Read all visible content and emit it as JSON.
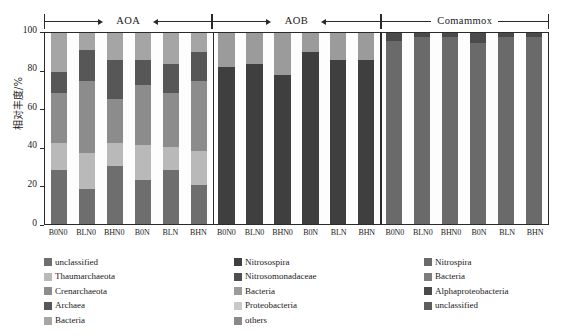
{
  "axes": {
    "y_title": "相对丰度/%",
    "y_ticks": [
      "0",
      "20",
      "40",
      "60",
      "80",
      "100"
    ]
  },
  "groups": [
    {
      "label": "AOA"
    },
    {
      "label": "AOB"
    },
    {
      "label": "Comammox"
    }
  ],
  "x_labels": [
    "B0N0",
    "BLN0",
    "BHN0",
    "B0N",
    "BLN",
    "BHN",
    "B0N0",
    "BLN0",
    "BHN0",
    "B0N",
    "BLN",
    "BHN",
    "B0N0",
    "BLN0",
    "BHN0",
    "B0N",
    "BLN",
    "BHN"
  ],
  "legend": {
    "columns": [
      {
        "items": [
          {
            "label": "unclassified",
            "color": "#6e6e6e"
          },
          {
            "label": "Thaumarchaeota",
            "color": "#b9b9b9"
          },
          {
            "label": "Crenarchaeota",
            "color": "#8c8c8c"
          },
          {
            "label": "Archaea",
            "color": "#575757"
          },
          {
            "label": "Bacteria",
            "color": "#a5a5a5"
          }
        ]
      },
      {
        "items": [
          {
            "label": "Nitrosospira",
            "color": "#3f3f3f"
          },
          {
            "label": "Nitrosomonadaceae",
            "color": "#4f4f4f"
          },
          {
            "label": "Bacteria",
            "color": "#9b9b9b"
          },
          {
            "label": "Proteobacteria",
            "color": "#c9c9c9"
          },
          {
            "label": "others",
            "color": "#8a8a8a"
          }
        ]
      },
      {
        "items": [
          {
            "label": "Nitrospira",
            "color": "#6a6a6a"
          },
          {
            "label": "Bacteria",
            "color": "#7d7d7d"
          },
          {
            "label": "Alphaproteobacteria",
            "color": "#4a4a4a"
          },
          {
            "label": "unclassified",
            "color": "#5e5e5e"
          }
        ]
      }
    ]
  },
  "chart_data": {
    "type": "bar",
    "title": "",
    "xlabel": "",
    "ylabel": "相对丰度/%",
    "ylim": [
      0,
      100
    ],
    "grid": false,
    "stacked": true,
    "legend_position": "below",
    "categories": [
      "AOA B0N0",
      "AOA BLN0",
      "AOA BHN0",
      "AOA B0N",
      "AOA BLN",
      "AOA BHN",
      "AOB B0N0",
      "AOB BLN0",
      "AOB BHN0",
      "AOB B0N",
      "AOB BLN",
      "AOB BHN",
      "Comammox B0N0",
      "Comammox BLN0",
      "Comammox BHN0",
      "Comammox B0N",
      "Comammox BLN",
      "Comammox BHN"
    ],
    "group_spans": [
      {
        "name": "AOA",
        "start": 0,
        "end": 5
      },
      {
        "name": "AOB",
        "start": 6,
        "end": 11
      },
      {
        "name": "Comammox",
        "start": 12,
        "end": 17
      }
    ],
    "series": [
      {
        "name": "unclassified",
        "color": "#6e6e6e",
        "values": [
          28,
          18,
          30,
          23,
          28,
          20,
          0,
          0,
          0,
          0,
          0,
          0,
          0,
          0,
          0,
          0,
          0,
          0
        ]
      },
      {
        "name": "Thaumarchaeota",
        "color": "#b9b9b9",
        "values": [
          14,
          19,
          12,
          18,
          12,
          18,
          0,
          0,
          0,
          0,
          0,
          0,
          0,
          0,
          0,
          0,
          0,
          0
        ]
      },
      {
        "name": "Crenarchaeota",
        "color": "#8c8c8c",
        "values": [
          26,
          37,
          23,
          31,
          28,
          36,
          0,
          0,
          0,
          0,
          0,
          0,
          0,
          0,
          0,
          0,
          0,
          0
        ]
      },
      {
        "name": "Archaea",
        "color": "#575757",
        "values": [
          11,
          16,
          20,
          13,
          15,
          15,
          0,
          0,
          0,
          0,
          0,
          0,
          0,
          0,
          0,
          0,
          0,
          0
        ]
      },
      {
        "name": "Bacteria (AOA)",
        "color": "#a5a5a5",
        "values": [
          20,
          9,
          14,
          14,
          16,
          10,
          0,
          0,
          0,
          0,
          0,
          0,
          0,
          0,
          0,
          0,
          0,
          0
        ]
      },
      {
        "name": "Nitrosospira",
        "color": "#3f3f3f",
        "values": [
          0,
          0,
          0,
          0,
          0,
          0,
          82,
          84,
          78,
          90,
          86,
          86,
          0,
          0,
          0,
          0,
          0,
          0
        ]
      },
      {
        "name": "Nitrosomonadaceae",
        "color": "#4f4f4f",
        "values": [
          0,
          0,
          0,
          0,
          0,
          0,
          0,
          0,
          0,
          0,
          0,
          0,
          0,
          0,
          0,
          0,
          0,
          0
        ]
      },
      {
        "name": "Bacteria (AOB)",
        "color": "#9b9b9b",
        "values": [
          0,
          0,
          0,
          0,
          0,
          0,
          18,
          16,
          22,
          10,
          14,
          14,
          0,
          0,
          0,
          0,
          0,
          0
        ]
      },
      {
        "name": "Nitrospira",
        "color": "#6a6a6a",
        "values": [
          0,
          0,
          0,
          0,
          0,
          0,
          0,
          0,
          0,
          0,
          0,
          0,
          96,
          98,
          98,
          95,
          98,
          98
        ]
      },
      {
        "name": "Alphaproteobacteria",
        "color": "#4a4a4a",
        "values": [
          0,
          0,
          0,
          0,
          0,
          0,
          0,
          0,
          0,
          0,
          0,
          0,
          4,
          2,
          2,
          5,
          2,
          2
        ]
      }
    ]
  },
  "rendering": {
    "bars": [
      {
        "segments": [
          {
            "name": "unclassified",
            "value": 28,
            "color": "#6e6e6e"
          },
          {
            "name": "Thaumarchaeota",
            "value": 14,
            "color": "#b9b9b9"
          },
          {
            "name": "Crenarchaeota",
            "value": 26,
            "color": "#8c8c8c"
          },
          {
            "name": "Archaea",
            "value": 11,
            "color": "#575757"
          },
          {
            "name": "Bacteria",
            "value": 20,
            "color": "#a5a5a5"
          }
        ]
      },
      {
        "segments": [
          {
            "name": "unclassified",
            "value": 18,
            "color": "#6e6e6e"
          },
          {
            "name": "Thaumarchaeota",
            "value": 19,
            "color": "#b9b9b9"
          },
          {
            "name": "Crenarchaeota",
            "value": 37,
            "color": "#8c8c8c"
          },
          {
            "name": "Archaea",
            "value": 16,
            "color": "#575757"
          },
          {
            "name": "Bacteria",
            "value": 9,
            "color": "#a5a5a5"
          }
        ]
      },
      {
        "segments": [
          {
            "name": "unclassified",
            "value": 30,
            "color": "#6e6e6e"
          },
          {
            "name": "Thaumarchaeota",
            "value": 12,
            "color": "#b9b9b9"
          },
          {
            "name": "Crenarchaeota",
            "value": 23,
            "color": "#8c8c8c"
          },
          {
            "name": "Archaea",
            "value": 20,
            "color": "#575757"
          },
          {
            "name": "Bacteria",
            "value": 14,
            "color": "#a5a5a5"
          }
        ]
      },
      {
        "segments": [
          {
            "name": "unclassified",
            "value": 23,
            "color": "#6e6e6e"
          },
          {
            "name": "Thaumarchaeota",
            "value": 18,
            "color": "#b9b9b9"
          },
          {
            "name": "Crenarchaeota",
            "value": 31,
            "color": "#8c8c8c"
          },
          {
            "name": "Archaea",
            "value": 13,
            "color": "#575757"
          },
          {
            "name": "Bacteria",
            "value": 14,
            "color": "#a5a5a5"
          }
        ]
      },
      {
        "segments": [
          {
            "name": "unclassified",
            "value": 28,
            "color": "#6e6e6e"
          },
          {
            "name": "Thaumarchaeota",
            "value": 12,
            "color": "#b9b9b9"
          },
          {
            "name": "Crenarchaeota",
            "value": 28,
            "color": "#8c8c8c"
          },
          {
            "name": "Archaea",
            "value": 15,
            "color": "#575757"
          },
          {
            "name": "Bacteria",
            "value": 16,
            "color": "#a5a5a5"
          }
        ]
      },
      {
        "segments": [
          {
            "name": "unclassified",
            "value": 20,
            "color": "#6e6e6e"
          },
          {
            "name": "Thaumarchaeota",
            "value": 18,
            "color": "#b9b9b9"
          },
          {
            "name": "Crenarchaeota",
            "value": 36,
            "color": "#8c8c8c"
          },
          {
            "name": "Archaea",
            "value": 15,
            "color": "#575757"
          },
          {
            "name": "Bacteria",
            "value": 10,
            "color": "#a5a5a5"
          }
        ]
      },
      {
        "segments": [
          {
            "name": "Nitrosospira",
            "value": 82,
            "color": "#3f3f3f"
          },
          {
            "name": "Bacteria",
            "value": 18,
            "color": "#9b9b9b"
          }
        ]
      },
      {
        "segments": [
          {
            "name": "Nitrosospira",
            "value": 84,
            "color": "#3f3f3f"
          },
          {
            "name": "Bacteria",
            "value": 16,
            "color": "#9b9b9b"
          }
        ]
      },
      {
        "segments": [
          {
            "name": "Nitrosospira",
            "value": 78,
            "color": "#3f3f3f"
          },
          {
            "name": "Bacteria",
            "value": 22,
            "color": "#9b9b9b"
          }
        ]
      },
      {
        "segments": [
          {
            "name": "Nitrosospira",
            "value": 90,
            "color": "#3f3f3f"
          },
          {
            "name": "Bacteria",
            "value": 10,
            "color": "#9b9b9b"
          }
        ]
      },
      {
        "segments": [
          {
            "name": "Nitrosospira",
            "value": 86,
            "color": "#3f3f3f"
          },
          {
            "name": "Bacteria",
            "value": 14,
            "color": "#9b9b9b"
          }
        ]
      },
      {
        "segments": [
          {
            "name": "Nitrosospira",
            "value": 86,
            "color": "#3f3f3f"
          },
          {
            "name": "Bacteria",
            "value": 14,
            "color": "#9b9b9b"
          }
        ]
      },
      {
        "segments": [
          {
            "name": "Nitrospira",
            "value": 96,
            "color": "#6a6a6a"
          },
          {
            "name": "Alphaproteobacteria",
            "value": 4,
            "color": "#4a4a4a"
          }
        ]
      },
      {
        "segments": [
          {
            "name": "Nitrospira",
            "value": 98,
            "color": "#6a6a6a"
          },
          {
            "name": "Alphaproteobacteria",
            "value": 2,
            "color": "#4a4a4a"
          }
        ]
      },
      {
        "segments": [
          {
            "name": "Nitrospira",
            "value": 98,
            "color": "#6a6a6a"
          },
          {
            "name": "Alphaproteobacteria",
            "value": 2,
            "color": "#4a4a4a"
          }
        ]
      },
      {
        "segments": [
          {
            "name": "Nitrospira",
            "value": 95,
            "color": "#6a6a6a"
          },
          {
            "name": "Alphaproteobacteria",
            "value": 5,
            "color": "#4a4a4a"
          }
        ]
      },
      {
        "segments": [
          {
            "name": "Nitrospira",
            "value": 98,
            "color": "#6a6a6a"
          },
          {
            "name": "Alphaproteobacteria",
            "value": 2,
            "color": "#4a4a4a"
          }
        ]
      },
      {
        "segments": [
          {
            "name": "Nitrospira",
            "value": 98,
            "color": "#6a6a6a"
          },
          {
            "name": "Alphaproteobacteria",
            "value": 2,
            "color": "#4a4a4a"
          }
        ]
      }
    ]
  }
}
